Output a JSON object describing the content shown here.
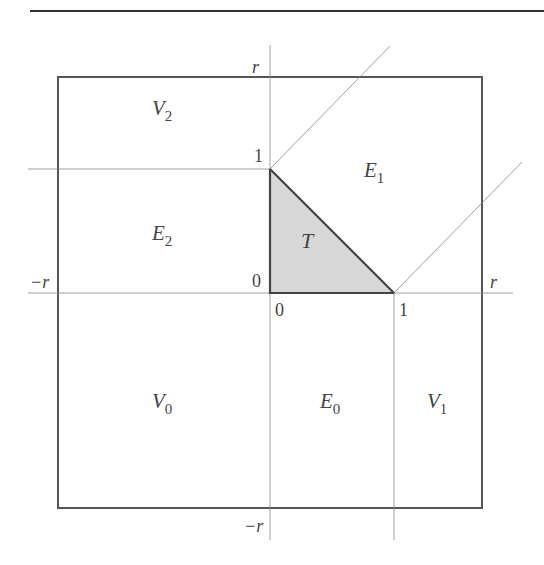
{
  "figure": {
    "type": "region-partition-diagram",
    "colors": {
      "line": "#555555",
      "thin": "#888888",
      "triangle_fill": "#d6d6d6",
      "triangle_edge": "#444444"
    },
    "axis_labels": {
      "top": "r",
      "bottom": "−r",
      "left": "−r",
      "right": "r"
    },
    "tick_labels": {
      "y_one": "1",
      "y_zero": "0",
      "x_zero": "0",
      "x_one": "1"
    },
    "regions": {
      "V2": {
        "base": "V",
        "sub": "2"
      },
      "E1": {
        "base": "E",
        "sub": "1"
      },
      "E2": {
        "base": "E",
        "sub": "2"
      },
      "T": {
        "base": "T",
        "sub": ""
      },
      "V0": {
        "base": "V",
        "sub": "0"
      },
      "E0": {
        "base": "E",
        "sub": "0"
      },
      "V1": {
        "base": "V",
        "sub": "1"
      }
    }
  }
}
